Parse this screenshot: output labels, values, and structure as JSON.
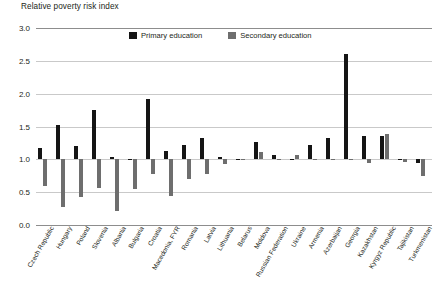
{
  "chart_data": {
    "type": "bar",
    "title": "Relative poverty risk index",
    "xlabel": "",
    "ylabel": "Relative poverty risk index",
    "ylim": [
      0.0,
      3.0
    ],
    "yticks": [
      "0.0",
      "0.5",
      "1.0",
      "1.5",
      "2.0",
      "2.5",
      "3.0"
    ],
    "ytick_values": [
      0.0,
      0.5,
      1.0,
      1.5,
      2.0,
      2.5,
      3.0
    ],
    "baseline": 1.0,
    "grid": true,
    "legend_position": "top-center",
    "categories": [
      "Czech Republic",
      "Hungary",
      "Poland",
      "Slovenia",
      "Albania",
      "Bulgaria",
      "Croatia",
      "Macedonia, FYR",
      "Romania",
      "Latvia",
      "Lithuania",
      "Belarus",
      "Moldova",
      "Russian Federation",
      "Ukraine",
      "Armenia",
      "Azerbaijan",
      "Georgia",
      "Kazakhstan",
      "Kyrgyz Republic",
      "Tajikistan",
      "Turkmenistan"
    ],
    "series": [
      {
        "name": "Primary education",
        "color": "#151515",
        "values": [
          1.18,
          1.53,
          1.2,
          1.75,
          1.04,
          1.0,
          1.92,
          1.12,
          1.22,
          1.33,
          1.03,
          1.0,
          1.27,
          1.07,
          1.0,
          1.22,
          1.32,
          2.6,
          1.35,
          1.35,
          1.0,
          0.94
        ]
      },
      {
        "name": "Secondary education",
        "color": "#6e6e6e",
        "values": [
          0.6,
          0.28,
          0.42,
          0.57,
          0.21,
          0.55,
          0.78,
          0.44,
          0.7,
          0.78,
          0.93,
          1.0,
          1.11,
          1.0,
          1.06,
          1.0,
          1.01,
          1.01,
          0.94,
          1.38,
          0.96,
          0.75
        ]
      }
    ],
    "legend": [
      {
        "label": "Primary education",
        "swatch": "primary-swatch",
        "color": "#151515"
      },
      {
        "label": "Secondary education",
        "swatch": "secondary-swatch",
        "color": "#6e6e6e"
      }
    ]
  }
}
